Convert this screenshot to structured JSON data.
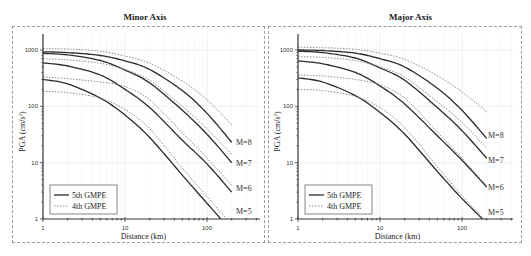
{
  "chart_data": [
    {
      "type": "line",
      "title": "Minor Axis",
      "xlabel": "Distance (km)",
      "ylabel": "PGA (cm/s²)",
      "xscale": "log",
      "yscale": "log",
      "xlim": [
        1,
        450
      ],
      "ylim": [
        1,
        1900
      ],
      "xticks": [
        "1",
        "10",
        "100"
      ],
      "yticks": [
        "1",
        "10",
        "100",
        "1000"
      ],
      "grid": true,
      "legend": {
        "position": "lower left",
        "entries": [
          "5th GMPE",
          "4th GMPE"
        ]
      },
      "x": [
        1,
        2,
        5,
        10,
        20,
        50,
        100,
        200
      ],
      "series": [
        {
          "name": "5th GMPE M=8",
          "style": "solid",
          "values": [
            930,
            900,
            800,
            640,
            450,
            190,
            75,
            23
          ]
        },
        {
          "name": "4th GMPE M=8",
          "style": "dotted",
          "values": [
            1060,
            1040,
            950,
            780,
            580,
            280,
            130,
            47
          ]
        },
        {
          "name": "5th GMPE M=7",
          "style": "solid",
          "values": [
            870,
            820,
            650,
            440,
            260,
            85,
            32,
            10
          ]
        },
        {
          "name": "4th GMPE M=7",
          "style": "dotted",
          "values": [
            700,
            670,
            580,
            450,
            290,
            100,
            40,
            14
          ]
        },
        {
          "name": "5th GMPE M=6",
          "style": "solid",
          "values": [
            590,
            520,
            360,
            200,
            95,
            25,
            9.5,
            3.0
          ]
        },
        {
          "name": "4th GMPE M=6",
          "style": "dotted",
          "values": [
            330,
            310,
            270,
            225,
            130,
            34,
            12,
            4.0
          ]
        },
        {
          "name": "5th GMPE M=5",
          "style": "solid",
          "values": [
            300,
            250,
            140,
            70,
            28,
            6.0,
            1.9,
            0.6
          ]
        },
        {
          "name": "4th GMPE M=5",
          "style": "dotted",
          "values": [
            185,
            175,
            140,
            88,
            40,
            8.0,
            2.5,
            0.8
          ]
        }
      ],
      "annotations": [
        "M=8",
        "M=7",
        "M=6",
        "M=5"
      ]
    },
    {
      "type": "line",
      "title": "Major Axis",
      "xlabel": "Distance (km)",
      "ylabel": "PGA (cm/s²)",
      "xscale": "log",
      "yscale": "log",
      "xlim": [
        1,
        450
      ],
      "ylim": [
        1,
        1900
      ],
      "xticks": [
        "1",
        "10",
        "100"
      ],
      "yticks": [
        "1",
        "10",
        "100",
        "1000"
      ],
      "grid": true,
      "legend": {
        "position": "lower left",
        "entries": [
          "5th GMPE",
          "4th GMPE"
        ]
      },
      "x": [
        1,
        2,
        5,
        10,
        20,
        50,
        100,
        200
      ],
      "series": [
        {
          "name": "5th GMPE M=8",
          "style": "solid",
          "values": [
            1000,
            980,
            880,
            700,
            500,
            210,
            85,
            27
          ]
        },
        {
          "name": "4th GMPE M=8",
          "style": "dotted",
          "values": [
            1120,
            1100,
            1030,
            880,
            680,
            350,
            180,
            80
          ]
        },
        {
          "name": "5th GMPE M=7",
          "style": "solid",
          "values": [
            950,
            900,
            720,
            480,
            290,
            95,
            37,
            12
          ]
        },
        {
          "name": "4th GMPE M=7",
          "style": "dotted",
          "values": [
            760,
            740,
            650,
            500,
            330,
            120,
            52,
            18
          ]
        },
        {
          "name": "5th GMPE M=6",
          "style": "solid",
          "values": [
            640,
            570,
            400,
            230,
            110,
            30,
            11,
            3.7
          ]
        },
        {
          "name": "4th GMPE M=6",
          "style": "dotted",
          "values": [
            360,
            345,
            300,
            240,
            140,
            35,
            12,
            3.9
          ]
        },
        {
          "name": "5th GMPE M=5",
          "style": "solid",
          "values": [
            320,
            270,
            155,
            78,
            32,
            7.0,
            2.3,
            0.85
          ]
        },
        {
          "name": "4th GMPE M=5",
          "style": "dotted",
          "values": [
            200,
            190,
            150,
            95,
            42,
            8.5,
            2.6,
            0.9
          ]
        }
      ],
      "annotations": [
        "M=8",
        "M=7",
        "M=6",
        "M=5"
      ]
    }
  ],
  "panels": [
    {
      "title": "Minor Axis",
      "xlabel": "Distance (km)",
      "ylabel": "PGA (cm/s",
      "ylabel_sup": "2",
      "ylabel_end": ")",
      "xticks": [
        "1",
        "10",
        "100"
      ],
      "yticks": [
        "1",
        "10",
        "100",
        "1000"
      ],
      "legend": [
        "5th GMPE",
        "4th GMPE"
      ],
      "mag_labels": [
        "M=8",
        "M=7",
        "M=6",
        "M=5"
      ]
    },
    {
      "title": "Major Axis",
      "xlabel": "Distance (km)",
      "ylabel": "PGA (cm/s",
      "ylabel_sup": "2",
      "ylabel_end": ")",
      "xticks": [
        "1",
        "10",
        "100"
      ],
      "yticks": [
        "1",
        "10",
        "100",
        "1000"
      ],
      "legend": [
        "5th GMPE",
        "4th GMPE"
      ],
      "mag_labels": [
        "M=8",
        "M=7",
        "M=6",
        "M=5"
      ]
    }
  ],
  "colors": {
    "solid": "#2b2b2b",
    "dotted": "#8a8a8a",
    "grid": "#e6e6e6",
    "frame": "#9a9a9a"
  }
}
